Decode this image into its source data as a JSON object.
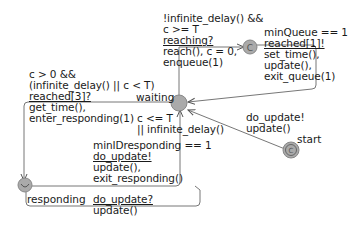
{
  "locations": {
    "waiting": {
      "name": "waiting",
      "type": "normal"
    },
    "committed_top": {
      "name": "",
      "marker": "C",
      "type": "committed"
    },
    "responding": {
      "name": "responding",
      "marker": "U",
      "type": "urgent"
    },
    "start": {
      "name": "start",
      "marker": "C",
      "type": "initial-committed"
    }
  },
  "edges": {
    "waiting_to_committed": {
      "guard_lines": [
        "!infinite_delay() &&",
        "c >= T"
      ],
      "sync": "reaching?",
      "update_lines": [
        "reach(), c = 0,",
        "enqueue(1)"
      ]
    },
    "committed_to_waiting": {
      "guard": "minQueue == 1",
      "sync": "reached[1]!",
      "update_lines": [
        "set_time(),",
        "update(),",
        "exit_queue(1)"
      ]
    },
    "waiting_to_responding": {
      "guard_lines": [
        "c > 0 &&",
        "(infinite_delay() || c < T)"
      ],
      "sync": "reached[3]?",
      "update_lines": [
        "get_time(),",
        "enter_responding(1)"
      ]
    },
    "responding_to_waiting": {
      "guard_lines": [
        "c <= T",
        "|| infinite_delay()",
        "minIDresponding == 1"
      ],
      "sync": "do_update!",
      "update_lines": [
        "update(),",
        "exit_responding()"
      ]
    },
    "responding_self_loop": {
      "sync": "do_update?",
      "update": "update()"
    },
    "start_to_waiting": {
      "sync": "do_update!",
      "update": "update()"
    }
  }
}
